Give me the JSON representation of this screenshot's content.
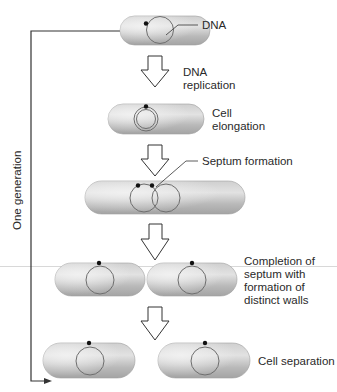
{
  "diagram": {
    "side_label": "One generation",
    "labels": {
      "dna": "DNA",
      "dna_replication_1": "DNA",
      "dna_replication_2": "replication",
      "cell_elongation_1": "Cell",
      "cell_elongation_2": "elongation",
      "septum_formation": "Septum formation",
      "completion_1": "Completion of",
      "completion_2": "septum with",
      "completion_3": "formation of",
      "completion_4": "distinct walls",
      "cell_separation": "Cell separation"
    },
    "stages": [
      "Single cell with DNA",
      "DNA replication",
      "Cell elongation",
      "Septum formation",
      "Completion of septum with formation of distinct walls",
      "Cell separation"
    ],
    "colors": {
      "cell_fill": "#b8b8b8",
      "cell_highlight": "#e6e6e6",
      "dna_circle": "#6e6e6e",
      "dna_dot": "#111111",
      "arrow_fill": "#ffffff",
      "arrow_stroke": "#333333",
      "bracket": "#333333"
    }
  }
}
